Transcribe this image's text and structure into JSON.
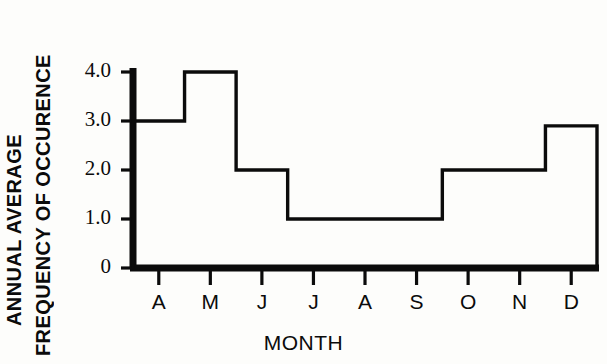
{
  "chart_data": {
    "type": "line",
    "style": "step-post",
    "title": "",
    "xlabel": "MONTH",
    "ylabel": "ANNUAL AVERAGE FREQUENCY OF OCCURENCE",
    "ylabel_lines": [
      "ANNUAL AVERAGE",
      "FREQUENCY OF OCCURENCE"
    ],
    "categories": [
      "A",
      "M",
      "J",
      "J",
      "A",
      "S",
      "O",
      "N",
      "D"
    ],
    "category_names": [
      "April",
      "May",
      "June",
      "July",
      "August",
      "September",
      "October",
      "November",
      "December"
    ],
    "values": [
      3.0,
      4.0,
      2.0,
      1.0,
      1.0,
      1.0,
      2.0,
      2.0,
      2.9
    ],
    "ylim": [
      0,
      4.0
    ],
    "yticks": [
      0,
      1.0,
      2.0,
      3.0,
      4.0
    ],
    "ytick_labels": [
      "0",
      "1.0",
      "2.0",
      "3.0",
      "4.0"
    ],
    "xtick_labels": [
      "A",
      "M",
      "J",
      "J",
      "A",
      "S",
      "O",
      "N",
      "D"
    ],
    "grid": false,
    "legend": false,
    "line_color": "#0b0b0b",
    "axis_color": "#0b0b0b",
    "background": "#fdfdfb"
  }
}
